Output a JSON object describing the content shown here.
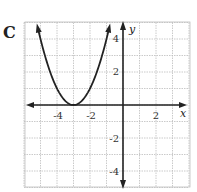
{
  "figure_label": "C",
  "chart_data": {
    "type": "line",
    "title": "",
    "xlabel": "x",
    "ylabel": "y",
    "xlim": [
      -6,
      4
    ],
    "ylim": [
      -5,
      5
    ],
    "grid": true,
    "x_tick_labels": [
      "-4",
      "-2",
      "2"
    ],
    "y_tick_labels": [
      "4",
      "2",
      "-2",
      "-4"
    ],
    "series": [
      {
        "name": "parabola",
        "equation": "y = (x + 3)^2",
        "vertex": [
          -3,
          0
        ],
        "x": [
          -5,
          -4,
          -3,
          -2,
          -1
        ],
        "y": [
          4,
          1,
          0,
          1,
          4
        ]
      }
    ]
  },
  "ticks": {
    "x_neg4": "-4",
    "x_neg2": "-2",
    "x_2": "2",
    "y_4": "4",
    "y_2": "2",
    "y_neg2": "-2",
    "y_neg4": "-4"
  },
  "axes": {
    "x_label": "x",
    "y_label": "y"
  }
}
